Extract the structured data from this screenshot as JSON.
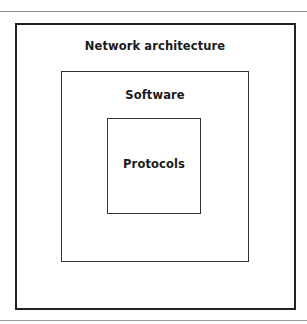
{
  "diagram": {
    "type": "nested-boxes",
    "layers": [
      {
        "level": 1,
        "label": "Network architecture"
      },
      {
        "level": 2,
        "label": "Software"
      },
      {
        "level": 3,
        "label": "Protocols"
      }
    ]
  }
}
